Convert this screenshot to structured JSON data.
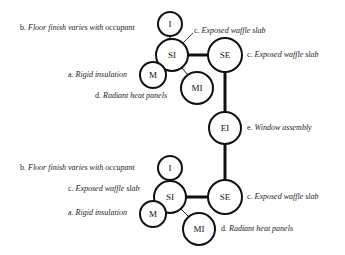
{
  "diagram": {
    "top": {
      "nodes": {
        "I": "I",
        "SI": "SI",
        "M": "M",
        "MI": "MI",
        "SE": "SE"
      },
      "labels": {
        "b": {
          "key": "b.",
          "text": "Floor finish varies with occupant"
        },
        "c_si": {
          "key": "c.",
          "text": "Exposed waffle slab"
        },
        "c_se": {
          "key": "c.",
          "text": "Exposed waffle slab"
        },
        "a": {
          "key": "a.",
          "text": "Rigid insulation"
        },
        "d": {
          "key": "d.",
          "text": "Radiant heat panels"
        }
      }
    },
    "middle": {
      "nodes": {
        "EI": "EI"
      },
      "labels": {
        "e": {
          "key": "e.",
          "text": "Window assembly"
        }
      }
    },
    "bottom": {
      "nodes": {
        "I": "I",
        "SI": "SI",
        "M": "M",
        "MI": "MI",
        "SE": "SE"
      },
      "labels": {
        "b": {
          "key": "b.",
          "text": "Floor finish varies with occupant"
        },
        "c_si": {
          "key": "c.",
          "text": "Exposed waffle slab"
        },
        "a": {
          "key": "a.",
          "text": "Rigid insulation"
        },
        "c_se": {
          "key": "c.",
          "text": "Exposed waffle slab"
        },
        "d": {
          "key": "d.",
          "text": "Radiant heat panels"
        }
      }
    },
    "colors": {
      "stroke": "#111111",
      "text": "#222222",
      "background": "#ffffff"
    }
  }
}
